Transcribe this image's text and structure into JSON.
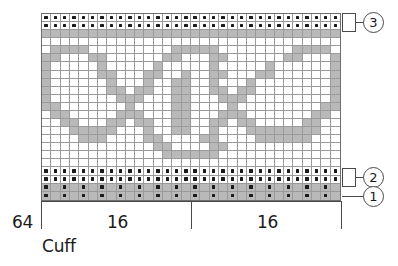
{
  "chart_data": {
    "type": "heatmap",
    "xlabel": "",
    "ylabel": "",
    "grid": true,
    "legend_position": "right",
    "columns": 32,
    "rows": 22,
    "cell_legend": {
      "white": "main color stitch",
      "gray": "contrast color stitch",
      "dot": "purl / pattern stitch marker"
    },
    "colors": {
      "main": "#ffffff",
      "contrast": "#b9b9b9",
      "dot": "#1a1a1a",
      "gridline": "#9a9a9a",
      "border": "#6e6e6e",
      "axis": "#4a4a4a",
      "text": "#1a1a1a"
    },
    "x_ticks": [
      {
        "label": "64",
        "position": "left-of-chart"
      },
      {
        "label": "16",
        "position": "first-repeat"
      },
      {
        "label": "16",
        "position": "second-repeat"
      }
    ],
    "annotations": [
      {
        "label": "Cuff",
        "position": "below-left"
      },
      {
        "label": "3",
        "rows": "top two rows"
      },
      {
        "label": "2",
        "rows": "two rows above cuff"
      },
      {
        "label": "1",
        "rows": "bottom row"
      }
    ],
    "cell_rows": [
      "DDDDDDDDDDDDDDDDDDDDDDDDDDDDDDDD",
      "DDDDDDDDDDDDDDDDDDDDDDDDDDDDDDDD",
      "GGGGGGGGGGGGGGGGGGGGGGGGGGGGGGGG",
      "WWWWWWWWWWWWWWWWWWWWWWWWWWWWWWWW",
      "WGGGGWWWWWWWWWGGGGGWWWWWWWWGGGGW",
      "GGWWWGGWWWWWWGGWWWGGWWWWWWGGWWWG",
      "GWWWWWGWWWWWGWWWWWGWWWWWGWWWWWWG",
      "GWWWWWGGWWWGGWWGWWGGWWWGGWWWWWWG",
      "GWWWWWWGWWWGWWGGWWGWWWGWWWWWWWWG",
      "GWWWWWWGGWGGWWGGWWGGWGGWWWWWWWWG",
      "GWWWWWWWGGGWWWGGWWWGGGWWWWWWWWWG",
      "GGWWWWWWWGWWWWGGWWWWGWWWWWWWWWGG",
      "WGGWWWWWGGGWWWGGWWWGGGWWWWWWWGGW",
      "WWGGWWWGGWGGWWGGWWGGWGGWWWWWGGWW",
      "WWWGGGGGWWWGWWGGWWGWWWGGGGGGGGWW",
      "WWWWGGGWWWWGGWWWWGGWWWWGGGGGGWWW",
      "WWWWWWWWWWWWGGWWWWGGWWWWWWWWWWWW",
      "WWWWWWWWWWWWWGGGGGGWWWWWWWWWWWWW",
      "WWWWWWWWWWWWWWWWWWWWWWWWWWWWWWWW",
      "DDDDDDDDDDDDDDDDDDDDDDDDDDDDDDDD",
      "DDDDDDDDDDDDDDDDDDDDDDDDDDDDDDDD",
      "PGPGPGPGPGPGPGPGPGPGPGPGPGPGPGPG",
      "PGPGPGPGPGPGPGPGPGPGPGPGPGPGPGPG"
    ]
  },
  "axis": {
    "label_left": "64",
    "label_repeat_1": "16",
    "label_repeat_2": "16",
    "label_section": "Cuff"
  },
  "callouts": {
    "top": "3",
    "middle": "2",
    "bottom": "1"
  }
}
